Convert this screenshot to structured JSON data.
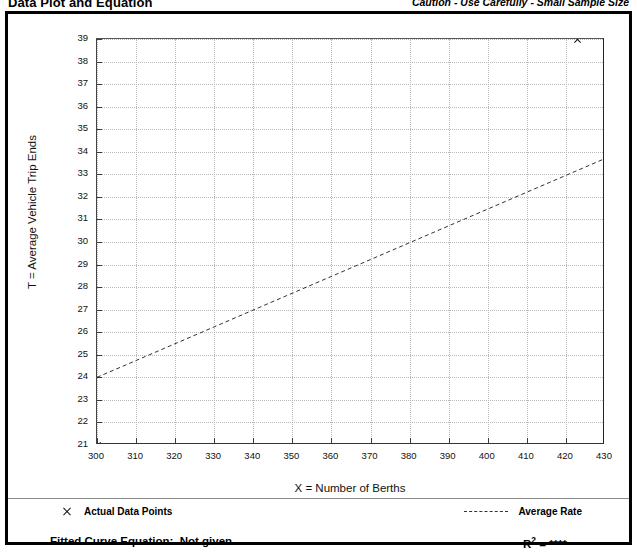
{
  "header": {
    "title": "Data Plot and Equation",
    "caution": "Caution - Use Carefully - Small Sample Size"
  },
  "legend": {
    "actual_points_label": "Actual Data Points",
    "average_rate_label": "Average Rate",
    "actual_marker_icon": "x-marker-icon",
    "average_line_icon": "dashed-line-icon"
  },
  "footer": {
    "fitted_curve_label": "Fitted Curve Equation:  Not given",
    "r_squared_label": "R",
    "r_squared_exponent": "2",
    "r_squared_value": " = ****"
  },
  "chart_data": {
    "type": "scatter",
    "title": "Data Plot and Equation",
    "xlabel": "X = Number of Berths",
    "ylabel": "T = Average Vehicle Trip Ends",
    "xlim": [
      300,
      430
    ],
    "ylim": [
      21,
      39
    ],
    "xticks": [
      300,
      310,
      320,
      330,
      340,
      350,
      360,
      370,
      380,
      390,
      400,
      410,
      420,
      430
    ],
    "yticks": [
      21,
      22,
      23,
      24,
      25,
      26,
      27,
      28,
      29,
      30,
      31,
      32,
      33,
      34,
      35,
      36,
      37,
      38,
      39
    ],
    "grid": true,
    "legend_position": "below-plot",
    "points": [
      {
        "x": 300,
        "y": 21
      },
      {
        "x": 423,
        "y": 39
      }
    ],
    "series": [
      {
        "name": "Average Rate",
        "type": "line",
        "style": "dashed",
        "x": [
          300,
          430
        ],
        "y": [
          24.0,
          33.7
        ]
      }
    ]
  }
}
